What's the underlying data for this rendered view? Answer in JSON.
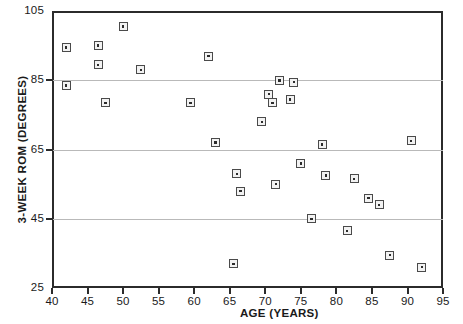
{
  "chart_data": {
    "type": "scatter",
    "title": "",
    "xlabel": "AGE (YEARS)",
    "ylabel": "3-WEEK ROM (DEGREES)",
    "xlim": [
      40,
      95
    ],
    "ylim": [
      25,
      105
    ],
    "xticks": [
      40,
      45,
      50,
      55,
      60,
      65,
      70,
      75,
      80,
      85,
      90,
      95
    ],
    "xticklabels": [
      "40",
      "45",
      "50",
      "55",
      "60",
      "65",
      "70",
      "75",
      "80",
      "85",
      "90",
      "95"
    ],
    "yticks": [
      25,
      45,
      65,
      85,
      105
    ],
    "yticklabels": [
      "25",
      "45",
      "65",
      "85",
      "105"
    ],
    "gridlines_y": [
      45,
      65,
      85
    ],
    "grid": "horizontal",
    "legend": null,
    "marker_style": "square-with-center-dot",
    "marker_color": "#4a4a4a",
    "points": [
      {
        "x": 42.0,
        "y": 94.5
      },
      {
        "x": 42.0,
        "y": 83.5
      },
      {
        "x": 46.5,
        "y": 95.0
      },
      {
        "x": 46.5,
        "y": 89.5
      },
      {
        "x": 47.5,
        "y": 78.5
      },
      {
        "x": 50.0,
        "y": 100.5
      },
      {
        "x": 52.5,
        "y": 88.0
      },
      {
        "x": 59.5,
        "y": 78.5
      },
      {
        "x": 62.0,
        "y": 92.0
      },
      {
        "x": 63.0,
        "y": 67.0
      },
      {
        "x": 65.5,
        "y": 32.0
      },
      {
        "x": 66.0,
        "y": 58.0
      },
      {
        "x": 66.5,
        "y": 53.0
      },
      {
        "x": 69.5,
        "y": 73.0
      },
      {
        "x": 70.5,
        "y": 81.0
      },
      {
        "x": 71.0,
        "y": 78.5
      },
      {
        "x": 71.5,
        "y": 55.0
      },
      {
        "x": 72.0,
        "y": 85.0
      },
      {
        "x": 73.5,
        "y": 79.5
      },
      {
        "x": 74.0,
        "y": 84.5
      },
      {
        "x": 75.0,
        "y": 61.0
      },
      {
        "x": 76.5,
        "y": 45.0
      },
      {
        "x": 78.0,
        "y": 66.5
      },
      {
        "x": 78.5,
        "y": 57.5
      },
      {
        "x": 81.5,
        "y": 41.5
      },
      {
        "x": 82.5,
        "y": 56.5
      },
      {
        "x": 84.5,
        "y": 51.0
      },
      {
        "x": 86.0,
        "y": 49.0
      },
      {
        "x": 87.5,
        "y": 34.5
      },
      {
        "x": 90.5,
        "y": 67.5
      },
      {
        "x": 92.0,
        "y": 31.0
      }
    ]
  }
}
